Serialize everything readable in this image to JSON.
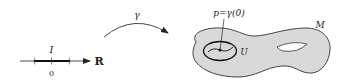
{
  "diagram": {
    "real_line": {
      "axis_label": "R",
      "interval_label": "I",
      "origin_label": "0"
    },
    "map": {
      "label": "γ"
    },
    "manifold": {
      "label": "M",
      "neighborhood_label": "U",
      "point_label": "p=γ(0)",
      "fill_color": "#d9d9d9",
      "stroke_color": "#333333"
    }
  }
}
